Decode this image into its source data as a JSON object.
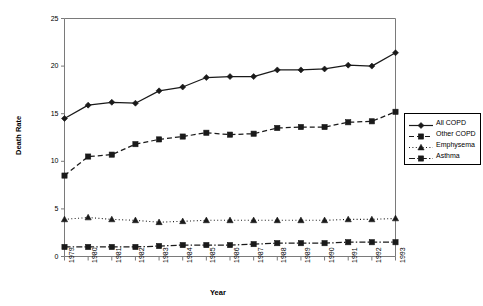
{
  "chart_data": {
    "type": "line",
    "title": "",
    "xlabel": "Year",
    "ylabel": "Death Rate",
    "grid": false,
    "legend_position": "right",
    "xlim": [
      1979,
      1993
    ],
    "ylim": [
      0,
      25
    ],
    "yticks": [
      0,
      5,
      10,
      15,
      20,
      25
    ],
    "categories": [
      "1979",
      "1980",
      "1981",
      "1982",
      "1983",
      "1984",
      "1985",
      "1986",
      "1987",
      "1988",
      "1989",
      "1990",
      "1991",
      "1992",
      "1993"
    ],
    "series": [
      {
        "name": "All COPD",
        "marker": "diamond",
        "linestyle": "solid",
        "values": [
          14.5,
          15.9,
          16.2,
          16.1,
          17.4,
          17.8,
          18.8,
          18.9,
          18.9,
          19.6,
          19.6,
          19.7,
          20.1,
          20.0,
          21.4
        ]
      },
      {
        "name": "Other COPD",
        "marker": "square",
        "linestyle": "dashed",
        "values": [
          8.5,
          10.5,
          10.7,
          11.8,
          12.3,
          12.6,
          13.0,
          12.8,
          12.9,
          13.5,
          13.6,
          13.6,
          14.1,
          14.2,
          15.2
        ]
      },
      {
        "name": "Emphysema",
        "marker": "triangle",
        "linestyle": "dotted",
        "values": [
          3.9,
          4.1,
          3.9,
          3.8,
          3.6,
          3.7,
          3.8,
          3.8,
          3.8,
          3.8,
          3.8,
          3.8,
          3.9,
          3.9,
          4.0
        ]
      },
      {
        "name": "Asthma",
        "marker": "square",
        "linestyle": "dashdot",
        "values": [
          1.0,
          1.0,
          1.0,
          1.0,
          1.1,
          1.2,
          1.2,
          1.2,
          1.3,
          1.4,
          1.4,
          1.4,
          1.5,
          1.5,
          1.5
        ]
      }
    ]
  },
  "axes": {
    "ylabel": "Death Rate",
    "xlabel": "Year"
  },
  "legend": {
    "items": [
      {
        "label": "All COPD"
      },
      {
        "label": "Other COPD"
      },
      {
        "label": "Emphysema"
      },
      {
        "label": "Asthma"
      }
    ]
  },
  "style": {
    "line_color": "#1a1a1a",
    "axis_color": "#7a7a7a",
    "text_color": "#000000",
    "background": "#ffffff"
  }
}
